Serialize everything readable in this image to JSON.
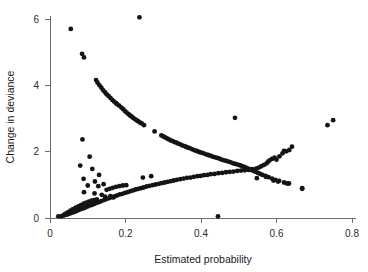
{
  "figure": {
    "title": "",
    "background_color": "#ffffff",
    "point_color": "#141414",
    "axis_color": "#6e6e6e",
    "width": 368,
    "height": 272
  },
  "axes": {
    "x_label": "Estimated probability",
    "y_label": "Change in deviance",
    "x_ticks": [
      "0",
      "0.2",
      "0.4",
      "0.6",
      "0.8"
    ],
    "y_ticks": [
      "0",
      "2",
      "4",
      "6"
    ]
  },
  "chart_data": {
    "type": "scatter",
    "title": "",
    "xlabel": "Estimated probability",
    "ylabel": "Change in deviance",
    "xlim": [
      0.0,
      0.8
    ],
    "ylim": [
      0.0,
      6.2
    ],
    "xticks": [
      0.0,
      0.2,
      0.4,
      0.6,
      0.8
    ],
    "yticks": [
      0,
      2,
      4,
      6
    ],
    "grid": false,
    "legend": null,
    "marker": "filled-circle",
    "marker_size_px": 2.4,
    "series": [
      {
        "name": "upper-descending-branch",
        "description": "Dense monotonically decreasing arc of points from upper-left to lower-right, crossing the ascending branch near x=0.52",
        "points": [
          [
            0.122,
            4.16
          ],
          [
            0.126,
            4.08
          ],
          [
            0.131,
            4.0
          ],
          [
            0.136,
            3.93
          ],
          [
            0.141,
            3.85
          ],
          [
            0.146,
            3.79
          ],
          [
            0.15,
            3.73
          ],
          [
            0.155,
            3.68
          ],
          [
            0.16,
            3.62
          ],
          [
            0.165,
            3.56
          ],
          [
            0.17,
            3.51
          ],
          [
            0.175,
            3.46
          ],
          [
            0.178,
            3.43
          ],
          [
            0.183,
            3.39
          ],
          [
            0.189,
            3.33
          ],
          [
            0.194,
            3.28
          ],
          [
            0.199,
            3.22
          ],
          [
            0.203,
            3.18
          ],
          [
            0.208,
            3.13
          ],
          [
            0.212,
            3.09
          ],
          [
            0.216,
            3.06
          ],
          [
            0.22,
            3.02
          ],
          [
            0.224,
            2.99
          ],
          [
            0.229,
            2.95
          ],
          [
            0.233,
            2.92
          ],
          [
            0.238,
            2.88
          ],
          [
            0.243,
            2.85
          ],
          [
            0.249,
            2.8
          ],
          [
            0.277,
            2.61
          ],
          [
            0.295,
            2.49
          ],
          [
            0.3,
            2.46
          ],
          [
            0.305,
            2.43
          ],
          [
            0.31,
            2.4
          ],
          [
            0.315,
            2.37
          ],
          [
            0.32,
            2.34
          ],
          [
            0.325,
            2.32
          ],
          [
            0.33,
            2.29
          ],
          [
            0.335,
            2.27
          ],
          [
            0.34,
            2.24
          ],
          [
            0.345,
            2.22
          ],
          [
            0.35,
            2.19
          ],
          [
            0.356,
            2.17
          ],
          [
            0.361,
            2.14
          ],
          [
            0.366,
            2.12
          ],
          [
            0.371,
            2.1
          ],
          [
            0.377,
            2.07
          ],
          [
            0.383,
            2.04
          ],
          [
            0.389,
            2.02
          ],
          [
            0.395,
            1.99
          ],
          [
            0.401,
            1.97
          ],
          [
            0.407,
            1.95
          ],
          [
            0.413,
            1.92
          ],
          [
            0.419,
            1.9
          ],
          [
            0.425,
            1.88
          ],
          [
            0.431,
            1.85
          ],
          [
            0.437,
            1.83
          ],
          [
            0.443,
            1.81
          ],
          [
            0.449,
            1.79
          ],
          [
            0.455,
            1.76
          ],
          [
            0.461,
            1.74
          ],
          [
            0.467,
            1.72
          ],
          [
            0.473,
            1.7
          ],
          [
            0.479,
            1.68
          ],
          [
            0.485,
            1.65
          ],
          [
            0.491,
            1.63
          ],
          [
            0.497,
            1.61
          ],
          [
            0.503,
            1.59
          ],
          [
            0.509,
            1.56
          ],
          [
            0.515,
            1.54
          ],
          [
            0.521,
            1.51
          ],
          [
            0.527,
            1.48
          ],
          [
            0.533,
            1.45
          ],
          [
            0.539,
            1.42
          ],
          [
            0.545,
            1.39
          ],
          [
            0.551,
            1.36
          ],
          [
            0.557,
            1.33
          ],
          [
            0.563,
            1.3
          ],
          [
            0.571,
            1.27
          ],
          [
            0.579,
            1.23
          ],
          [
            0.588,
            1.19
          ],
          [
            0.597,
            1.15
          ],
          [
            0.607,
            1.12
          ],
          [
            0.62,
            1.07
          ],
          [
            0.633,
            1.04
          ],
          [
            0.668,
            0.9
          ]
        ]
      },
      {
        "name": "lower-ascending-branch-main",
        "description": "Dense monotonically increasing arc rising from the origin to the upper right, crossing the descending branch near x=0.52",
        "points": [
          [
            0.03,
            0.05
          ],
          [
            0.038,
            0.08
          ],
          [
            0.045,
            0.1
          ],
          [
            0.052,
            0.13
          ],
          [
            0.058,
            0.16
          ],
          [
            0.064,
            0.18
          ],
          [
            0.07,
            0.21
          ],
          [
            0.076,
            0.24
          ],
          [
            0.082,
            0.27
          ],
          [
            0.088,
            0.29
          ],
          [
            0.094,
            0.32
          ],
          [
            0.1,
            0.35
          ],
          [
            0.106,
            0.38
          ],
          [
            0.112,
            0.4
          ],
          [
            0.118,
            0.43
          ],
          [
            0.124,
            0.46
          ],
          [
            0.13,
            0.48
          ],
          [
            0.136,
            0.51
          ],
          [
            0.143,
            0.54
          ],
          [
            0.15,
            0.57
          ],
          [
            0.157,
            0.6
          ],
          [
            0.164,
            0.63
          ],
          [
            0.171,
            0.65
          ],
          [
            0.178,
            0.68
          ],
          [
            0.185,
            0.71
          ],
          [
            0.192,
            0.73
          ],
          [
            0.199,
            0.76
          ],
          [
            0.206,
            0.78
          ],
          [
            0.213,
            0.81
          ],
          [
            0.22,
            0.83
          ],
          [
            0.227,
            0.86
          ],
          [
            0.234,
            0.88
          ],
          [
            0.241,
            0.9
          ],
          [
            0.248,
            0.92
          ],
          [
            0.256,
            0.95
          ],
          [
            0.264,
            0.97
          ],
          [
            0.272,
            0.99
          ],
          [
            0.28,
            1.01
          ],
          [
            0.288,
            1.03
          ],
          [
            0.296,
            1.05
          ],
          [
            0.304,
            1.07
          ],
          [
            0.312,
            1.09
          ],
          [
            0.32,
            1.11
          ],
          [
            0.328,
            1.13
          ],
          [
            0.336,
            1.15
          ],
          [
            0.345,
            1.17
          ],
          [
            0.354,
            1.19
          ],
          [
            0.363,
            1.21
          ],
          [
            0.372,
            1.22
          ],
          [
            0.381,
            1.24
          ],
          [
            0.39,
            1.26
          ],
          [
            0.399,
            1.27
          ],
          [
            0.408,
            1.29
          ],
          [
            0.417,
            1.3
          ],
          [
            0.426,
            1.32
          ],
          [
            0.436,
            1.33
          ],
          [
            0.446,
            1.35
          ],
          [
            0.456,
            1.36
          ],
          [
            0.466,
            1.38
          ],
          [
            0.476,
            1.39
          ],
          [
            0.486,
            1.4
          ],
          [
            0.496,
            1.42
          ],
          [
            0.506,
            1.43
          ],
          [
            0.516,
            1.44
          ],
          [
            0.526,
            1.45
          ],
          [
            0.536,
            1.47
          ],
          [
            0.546,
            1.49
          ],
          [
            0.553,
            1.52
          ],
          [
            0.56,
            1.56
          ],
          [
            0.567,
            1.6
          ],
          [
            0.574,
            1.65
          ],
          [
            0.578,
            1.7
          ],
          [
            0.582,
            1.74
          ],
          [
            0.588,
            1.78
          ],
          [
            0.595,
            1.82
          ],
          [
            0.6,
            1.76
          ],
          [
            0.608,
            1.86
          ],
          [
            0.616,
            1.95
          ],
          [
            0.62,
            2.02
          ],
          [
            0.626,
            2.01
          ],
          [
            0.634,
            2.05
          ],
          [
            0.641,
            2.15
          ]
        ]
      },
      {
        "name": "lower-ascending-branch-secondary",
        "description": "Second shallower dense band emanating from near the origin, slightly above the main ascending band at small x",
        "points": [
          [
            0.033,
            0.07
          ],
          [
            0.04,
            0.12
          ],
          [
            0.047,
            0.17
          ],
          [
            0.054,
            0.22
          ],
          [
            0.061,
            0.27
          ],
          [
            0.068,
            0.31
          ],
          [
            0.075,
            0.35
          ],
          [
            0.082,
            0.39
          ],
          [
            0.089,
            0.43
          ],
          [
            0.096,
            0.46
          ],
          [
            0.103,
            0.49
          ],
          [
            0.11,
            0.52
          ],
          [
            0.117,
            0.54
          ],
          [
            0.124,
            0.56
          ]
        ]
      },
      {
        "name": "mid-left-scatter",
        "description": "Loose scattered points in the lower-left quadrant between the two dense bands",
        "points": [
          [
            0.086,
            2.37
          ],
          [
            0.105,
            1.85
          ],
          [
            0.08,
            1.58
          ],
          [
            0.112,
            1.48
          ],
          [
            0.13,
            1.3
          ],
          [
            0.089,
            1.18
          ],
          [
            0.119,
            1.1
          ],
          [
            0.1,
            0.98
          ],
          [
            0.128,
            0.96
          ],
          [
            0.142,
            1.02
          ],
          [
            0.09,
            0.78
          ],
          [
            0.118,
            0.74
          ],
          [
            0.137,
            0.7
          ],
          [
            0.15,
            0.85
          ],
          [
            0.158,
            0.88
          ],
          [
            0.166,
            0.91
          ],
          [
            0.175,
            0.94
          ],
          [
            0.184,
            0.96
          ],
          [
            0.193,
            0.98
          ],
          [
            0.202,
            0.99
          ],
          [
            0.146,
            0.64
          ],
          [
            0.16,
            0.66
          ],
          [
            0.168,
            0.62
          ]
        ]
      },
      {
        "name": "mid-scatter-right",
        "description": "Isolated points to the right of the mid-left cluster",
        "points": [
          [
            0.246,
            1.22
          ],
          [
            0.268,
            1.26
          ]
        ]
      },
      {
        "name": "lower-right-scatter",
        "description": "Isolated points falling below the descending branch on the right side",
        "points": [
          [
            0.548,
            1.2
          ],
          [
            0.572,
            1.24
          ],
          [
            0.592,
            1.13
          ],
          [
            0.604,
            1.1
          ],
          [
            0.628,
            1.04
          ],
          [
            0.668,
            0.88
          ]
        ]
      },
      {
        "name": "outliers",
        "description": "Isolated extreme points lying far from both dense bands",
        "points": [
          [
            0.055,
            5.7
          ],
          [
            0.085,
            4.95
          ],
          [
            0.09,
            4.84
          ],
          [
            0.237,
            6.05
          ],
          [
            0.49,
            3.02
          ],
          [
            0.445,
            0.05
          ],
          [
            0.022,
            0.05
          ],
          [
            0.735,
            2.8
          ],
          [
            0.75,
            2.95
          ]
        ]
      }
    ]
  }
}
